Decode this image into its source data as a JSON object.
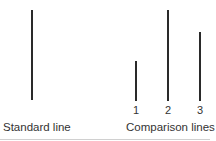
{
  "standard": {
    "label": "Standard line"
  },
  "comparison": {
    "label": "Comparison lines",
    "lines": [
      {
        "number": "1"
      },
      {
        "number": "2"
      },
      {
        "number": "3"
      }
    ]
  }
}
